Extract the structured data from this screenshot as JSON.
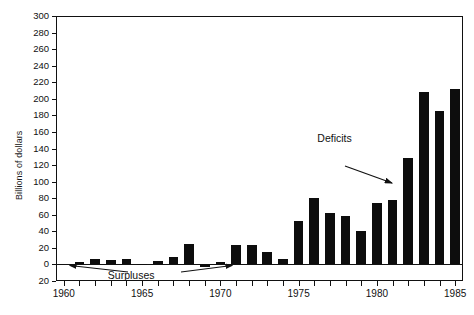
{
  "chart_data": {
    "type": "bar",
    "title": "",
    "xlabel": "",
    "ylabel": "Billions of dollars",
    "ylim": [
      -20,
      300
    ],
    "xlim": [
      1959.5,
      1985.5
    ],
    "grid": false,
    "legend": "none",
    "y_ticks": [
      300,
      280,
      260,
      240,
      220,
      200,
      180,
      160,
      140,
      120,
      100,
      80,
      60,
      40,
      20,
      0,
      -20
    ],
    "y_tick_labels": [
      "300",
      "280",
      "260",
      "240",
      "220",
      "200",
      "180",
      "160",
      "140",
      "120",
      "100",
      "80",
      "60",
      "40",
      "20",
      "0",
      "20"
    ],
    "x_ticks": [
      1960,
      1961,
      1962,
      1963,
      1964,
      1965,
      1966,
      1967,
      1968,
      1969,
      1970,
      1971,
      1972,
      1973,
      1974,
      1975,
      1976,
      1977,
      1978,
      1979,
      1980,
      1981,
      1982,
      1983,
      1984,
      1985
    ],
    "x_tick_labels_major": [
      "1960",
      "1965",
      "1970",
      "1975",
      "1980",
      "1985"
    ],
    "x_major_years": [
      1960,
      1965,
      1970,
      1975,
      1980,
      1985
    ],
    "categories": [
      1960,
      1961,
      1962,
      1963,
      1964,
      1965,
      1966,
      1967,
      1968,
      1969,
      1970,
      1971,
      1972,
      1973,
      1974,
      1975,
      1976,
      1977,
      1978,
      1979,
      1980,
      1981,
      1982,
      1983,
      1984,
      1985
    ],
    "values": [
      0,
      3,
      7,
      5,
      6,
      1,
      4,
      9,
      25,
      -3,
      3,
      23,
      23,
      15,
      6,
      53,
      80,
      62,
      58,
      40,
      74,
      78,
      128,
      208,
      185,
      212
    ],
    "annotations": [
      {
        "id": "surpluses",
        "text": "Surpluses",
        "x": 1964.6,
        "y": -14
      },
      {
        "id": "deficits",
        "text": "Deficits",
        "x": 1977.6,
        "y": 152
      }
    ]
  },
  "labels": {
    "y_axis_title": "Billions of dollars",
    "annotation_surpluses": "Surpluses",
    "annotation_deficits": "Deficits"
  },
  "colors": {
    "bar": "#0d0d0d",
    "axis": "#111111",
    "background": "#ffffff"
  }
}
